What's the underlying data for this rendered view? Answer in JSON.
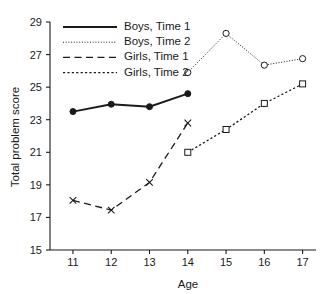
{
  "chart_data": {
    "type": "line",
    "title": "",
    "xlabel": "Age",
    "ylabel": "Total problem score",
    "x": [
      11,
      12,
      13,
      14,
      15,
      16,
      17
    ],
    "xlim": [
      10.4,
      17.35
    ],
    "ylim": [
      15,
      29
    ],
    "xticks": [
      "11",
      "12",
      "13",
      "14",
      "15",
      "16",
      "17"
    ],
    "yticks": [
      "15",
      "17",
      "19",
      "21",
      "23",
      "25",
      "27",
      "29"
    ],
    "grid": false,
    "legend_position": "top-center",
    "series": [
      {
        "name": "Boys, Time 1",
        "x": [
          11,
          12,
          13,
          14
        ],
        "values": [
          23.5,
          23.95,
          23.8,
          24.6
        ],
        "marker": "filled-circle",
        "linestyle": "solid",
        "color": "#1a1a1a"
      },
      {
        "name": "Boys, Time 2",
        "x": [
          14,
          15,
          16,
          17
        ],
        "values": [
          25.9,
          28.3,
          26.35,
          26.75
        ],
        "marker": "open-circle",
        "linestyle": "dotted",
        "color": "#1a1a1a"
      },
      {
        "name": "Girls, Time 1",
        "x": [
          11,
          12,
          13,
          14
        ],
        "values": [
          18.05,
          17.45,
          19.15,
          22.8
        ],
        "marker": "cross",
        "linestyle": "long-dash",
        "color": "#1a1a1a"
      },
      {
        "name": "Girls, Time 2",
        "x": [
          14,
          15,
          16,
          17
        ],
        "values": [
          21.0,
          22.4,
          24.0,
          25.2
        ],
        "marker": "open-square",
        "linestyle": "short-dash",
        "color": "#1a1a1a"
      }
    ]
  },
  "legend": {
    "items": [
      {
        "label": "Boys, Time 1"
      },
      {
        "label": "Boys, Time 2"
      },
      {
        "label": "Girls, Time 1"
      },
      {
        "label": "Girls, Time 2"
      }
    ]
  }
}
